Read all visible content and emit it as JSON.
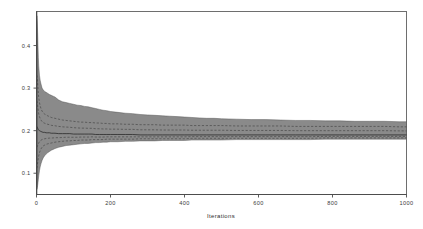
{
  "figure": {
    "kind": "convergence-envelope-plot",
    "background_color": "#ffffff",
    "frame_color": "#6e6e6e",
    "band_fill_color": "#8a8a8a",
    "band_edge_color": "#4f4f4f",
    "median_line_color": "#2a2a2a",
    "quantile_line_color": "#3c3c3c",
    "quantile_line_style": "dashed"
  },
  "chart_data": {
    "type": "area",
    "title": "",
    "subtitle": "",
    "xlabel": "Iterations",
    "ylabel": "",
    "xlim": [
      0,
      1000
    ],
    "ylim": [
      0.05,
      0.48
    ],
    "grid": false,
    "legend": "none",
    "x_ticks": [
      0,
      200,
      400,
      600,
      800,
      1000
    ],
    "x_tick_labels": [
      "0",
      "200",
      "400",
      "600",
      "800",
      "1000"
    ],
    "y_ticks": [
      0.1,
      0.2,
      0.3,
      0.4
    ],
    "y_tick_labels": [
      "0.1",
      "0.2",
      "0.3",
      "0.4"
    ],
    "annotations": [],
    "x": [
      1,
      2,
      3,
      4,
      5,
      6,
      8,
      10,
      12,
      15,
      18,
      22,
      26,
      30,
      35,
      40,
      45,
      50,
      60,
      70,
      80,
      90,
      100,
      110,
      120,
      130,
      140,
      150,
      160,
      170,
      180,
      190,
      200,
      220,
      240,
      260,
      280,
      300,
      320,
      340,
      360,
      380,
      400,
      420,
      440,
      460,
      480,
      500,
      540,
      580,
      620,
      660,
      700,
      740,
      780,
      820,
      860,
      900,
      940,
      980,
      1000
    ],
    "series": [
      {
        "name": "upper extreme quantile",
        "role": "band-upper",
        "values": [
          0.47,
          0.455,
          0.43,
          0.4,
          0.372,
          0.352,
          0.33,
          0.318,
          0.31,
          0.3,
          0.296,
          0.292,
          0.29,
          0.288,
          0.285,
          0.283,
          0.281,
          0.279,
          0.272,
          0.268,
          0.266,
          0.264,
          0.262,
          0.26,
          0.259,
          0.257,
          0.256,
          0.254,
          0.252,
          0.25,
          0.248,
          0.247,
          0.245,
          0.243,
          0.241,
          0.24,
          0.238,
          0.237,
          0.236,
          0.235,
          0.234,
          0.233,
          0.232,
          0.231,
          0.23,
          0.229,
          0.229,
          0.228,
          0.227,
          0.226,
          0.226,
          0.225,
          0.224,
          0.224,
          0.223,
          0.223,
          0.222,
          0.222,
          0.222,
          0.221,
          0.221
        ]
      },
      {
        "name": "upper inner quantile",
        "role": "quantile-dashed-upper",
        "values": [
          0.33,
          0.322,
          0.312,
          0.3,
          0.288,
          0.278,
          0.266,
          0.258,
          0.252,
          0.246,
          0.242,
          0.239,
          0.237,
          0.235,
          0.233,
          0.231,
          0.23,
          0.229,
          0.227,
          0.225,
          0.224,
          0.223,
          0.222,
          0.221,
          0.22,
          0.22,
          0.219,
          0.219,
          0.218,
          0.218,
          0.217,
          0.217,
          0.216,
          0.216,
          0.215,
          0.215,
          0.214,
          0.214,
          0.214,
          0.213,
          0.213,
          0.213,
          0.213,
          0.212,
          0.212,
          0.212,
          0.212,
          0.212,
          0.211,
          0.211,
          0.211,
          0.211,
          0.21,
          0.21,
          0.21,
          0.21,
          0.21,
          0.21,
          0.21,
          0.209,
          0.209
        ]
      },
      {
        "name": "running median",
        "role": "median",
        "values": [
          0.21,
          0.208,
          0.206,
          0.204,
          0.202,
          0.201,
          0.2,
          0.199,
          0.198,
          0.197,
          0.196,
          0.196,
          0.195,
          0.195,
          0.195,
          0.194,
          0.194,
          0.194,
          0.193,
          0.193,
          0.193,
          0.193,
          0.192,
          0.192,
          0.192,
          0.192,
          0.192,
          0.192,
          0.191,
          0.191,
          0.191,
          0.191,
          0.191,
          0.191,
          0.191,
          0.191,
          0.19,
          0.19,
          0.19,
          0.19,
          0.19,
          0.19,
          0.19,
          0.19,
          0.19,
          0.19,
          0.19,
          0.19,
          0.19,
          0.19,
          0.19,
          0.19,
          0.19,
          0.19,
          0.19,
          0.19,
          0.19,
          0.19,
          0.19,
          0.19,
          0.19
        ]
      },
      {
        "name": "lower inner quantile",
        "role": "quantile-dashed-lower",
        "values": [
          0.112,
          0.118,
          0.124,
          0.13,
          0.136,
          0.141,
          0.148,
          0.153,
          0.157,
          0.161,
          0.164,
          0.166,
          0.168,
          0.169,
          0.17,
          0.171,
          0.172,
          0.173,
          0.174,
          0.175,
          0.176,
          0.176,
          0.177,
          0.177,
          0.178,
          0.178,
          0.178,
          0.179,
          0.179,
          0.179,
          0.179,
          0.18,
          0.18,
          0.18,
          0.18,
          0.18,
          0.181,
          0.181,
          0.181,
          0.181,
          0.181,
          0.181,
          0.181,
          0.182,
          0.182,
          0.182,
          0.182,
          0.182,
          0.182,
          0.182,
          0.182,
          0.182,
          0.182,
          0.182,
          0.183,
          0.183,
          0.183,
          0.183,
          0.183,
          0.183,
          0.183
        ]
      },
      {
        "name": "lower extreme quantile",
        "role": "band-lower",
        "values": [
          0.062,
          0.066,
          0.071,
          0.078,
          0.086,
          0.094,
          0.106,
          0.115,
          0.122,
          0.13,
          0.136,
          0.141,
          0.145,
          0.148,
          0.151,
          0.154,
          0.156,
          0.158,
          0.161,
          0.163,
          0.165,
          0.166,
          0.167,
          0.168,
          0.169,
          0.17,
          0.17,
          0.171,
          0.172,
          0.172,
          0.173,
          0.173,
          0.174,
          0.174,
          0.175,
          0.175,
          0.176,
          0.176,
          0.176,
          0.177,
          0.177,
          0.177,
          0.177,
          0.178,
          0.178,
          0.178,
          0.178,
          0.178,
          0.179,
          0.179,
          0.179,
          0.179,
          0.179,
          0.179,
          0.18,
          0.18,
          0.18,
          0.18,
          0.18,
          0.18,
          0.18
        ]
      }
    ]
  }
}
